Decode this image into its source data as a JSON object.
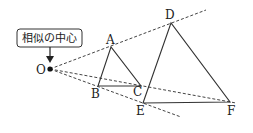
{
  "callout": {
    "text": "相似の中心"
  },
  "points": {
    "O": {
      "label": "O",
      "x": 50,
      "y": 69
    },
    "A": {
      "label": "A",
      "x": 111,
      "y": 47
    },
    "B": {
      "label": "B",
      "x": 98,
      "y": 86
    },
    "C": {
      "label": "C",
      "x": 141,
      "y": 86
    },
    "D": {
      "label": "D",
      "x": 171,
      "y": 23
    },
    "E": {
      "label": "E",
      "x": 143,
      "y": 103
    },
    "F": {
      "label": "F",
      "x": 230,
      "y": 102
    }
  },
  "colors": {
    "stroke": "#333333",
    "dash": "#444444",
    "text": "#222222"
  }
}
